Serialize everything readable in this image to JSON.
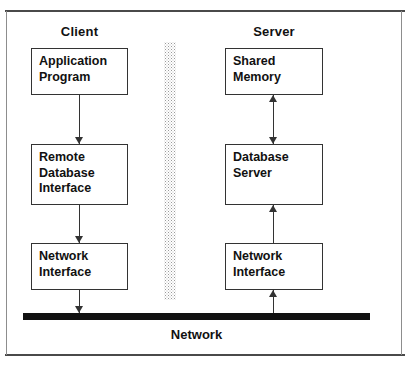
{
  "diagram": {
    "columns": [
      {
        "key": "client",
        "label": "Client"
      },
      {
        "key": "server",
        "label": "Server"
      }
    ],
    "client_nodes": [
      {
        "id": "application-program",
        "lines": [
          "Application",
          "Program"
        ]
      },
      {
        "id": "remote-database-interface",
        "lines": [
          "Remote",
          "Database",
          "Interface"
        ]
      },
      {
        "id": "network-interface",
        "lines": [
          "Network",
          "Interface"
        ]
      }
    ],
    "server_nodes": [
      {
        "id": "shared-memory",
        "lines": [
          "Shared",
          "Memory"
        ]
      },
      {
        "id": "database-server",
        "lines": [
          "Database",
          "Server"
        ]
      },
      {
        "id": "network-interface",
        "lines": [
          "Network",
          "Interface"
        ]
      }
    ],
    "connectors": [
      {
        "id": "app-to-rdi",
        "from": "Application Program",
        "to": "Remote Database Interface",
        "direction": "down"
      },
      {
        "id": "rdi-to-nif",
        "from": "Remote Database Interface",
        "to": "Network Interface",
        "direction": "down"
      },
      {
        "id": "nif-to-net",
        "from": "Network Interface",
        "to": "Network",
        "direction": "down"
      },
      {
        "id": "sm-to-dbs",
        "from": "Shared Memory",
        "to": "Database Server",
        "direction": "both"
      },
      {
        "id": "dbs-to-nif",
        "from": "Network Interface",
        "to": "Database Server",
        "direction": "up"
      },
      {
        "id": "net-to-nif",
        "from": "Network",
        "to": "Network Interface",
        "direction": "up"
      }
    ],
    "bus": {
      "label": "Network",
      "color": "#111111"
    },
    "divider": {
      "name": "client-server-boundary",
      "style": "stippled"
    },
    "colors": {
      "box_border": "#333333",
      "text": "#111111",
      "frame": "#4a4a4a",
      "bus": "#111111",
      "background": "#ffffff"
    }
  }
}
